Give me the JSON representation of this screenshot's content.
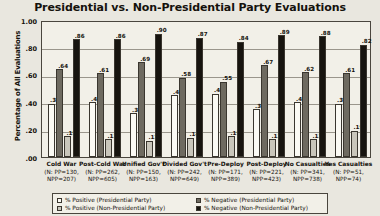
{
  "chart_data": {
    "type": "bar",
    "title": "Presidential vs. Non-Presidential Party Evaluations",
    "xlabel": "",
    "ylabel": "Percentage of All Evaluations",
    "ylim": [
      0,
      1.0
    ],
    "ytick_labels": [
      "1.00",
      ".80",
      ".60",
      ".40",
      ".20",
      ".00"
    ],
    "ytick_values": [
      1.0,
      0.8,
      0.6,
      0.4,
      0.2,
      0.0
    ],
    "grid": true,
    "legend_position": "bottom",
    "categories": [
      "Cold War",
      "Post-Cold War",
      "Unified Gov't",
      "Divided Gov't",
      "Pre-Deploy",
      "Post-Deploy",
      "No Casualties",
      "Yes Casualties"
    ],
    "category_notes": [
      "(N: PP=130, NPP=207)",
      "(N: PP=262, NPP=605)",
      "(N: PP=150, NPP=163)",
      "(N: PP=242, NPP=649)",
      "(N: PP=171, NPP=389)",
      "(N: PP=221, NPP=423)",
      "(N: PP=341, NPP=738)",
      "(N: PP=51, NPP=74)"
    ],
    "series": [
      {
        "name": "% Positive (Presidential Party)",
        "color": "#fbfaf4",
        "values": [
          0.39,
          0.4,
          0.32,
          0.45,
          0.46,
          0.35,
          0.4,
          0.39
        ],
        "labels": [
          ".39",
          ".40",
          ".32",
          ".45",
          ".46",
          ".35",
          ".40",
          ".39"
        ]
      },
      {
        "name": "% Negative (Presidential Party)",
        "color": "#6e6a60",
        "values": [
          0.64,
          0.61,
          0.69,
          0.58,
          0.55,
          0.67,
          0.62,
          0.61
        ],
        "labels": [
          ".64",
          ".61",
          ".69",
          ".58",
          ".55",
          ".67",
          ".62",
          ".61"
        ]
      },
      {
        "name": "% Positive (Non-Presidential Party)",
        "color": "#c9c6bb",
        "values": [
          0.15,
          0.13,
          0.12,
          0.14,
          0.15,
          0.13,
          0.13,
          0.19
        ],
        "labels": [
          ".15",
          ".13",
          ".12",
          ".14",
          ".15",
          ".13",
          ".13",
          ".19"
        ]
      },
      {
        "name": "% Negative (Non-Presidential Party)",
        "color": "#17140f",
        "values": [
          0.86,
          0.86,
          0.9,
          0.87,
          0.84,
          0.89,
          0.88,
          0.82
        ],
        "labels": [
          ".86",
          ".86",
          ".90",
          ".87",
          ".84",
          ".89",
          ".88",
          ".82"
        ]
      }
    ]
  },
  "legend": {
    "items": [
      "% Positive (Presidential Party)",
      "% Positive (Non-Presidential Party)",
      "% Negative (Presidential Party)",
      "% Negative (Non-Presidential Party)"
    ]
  }
}
